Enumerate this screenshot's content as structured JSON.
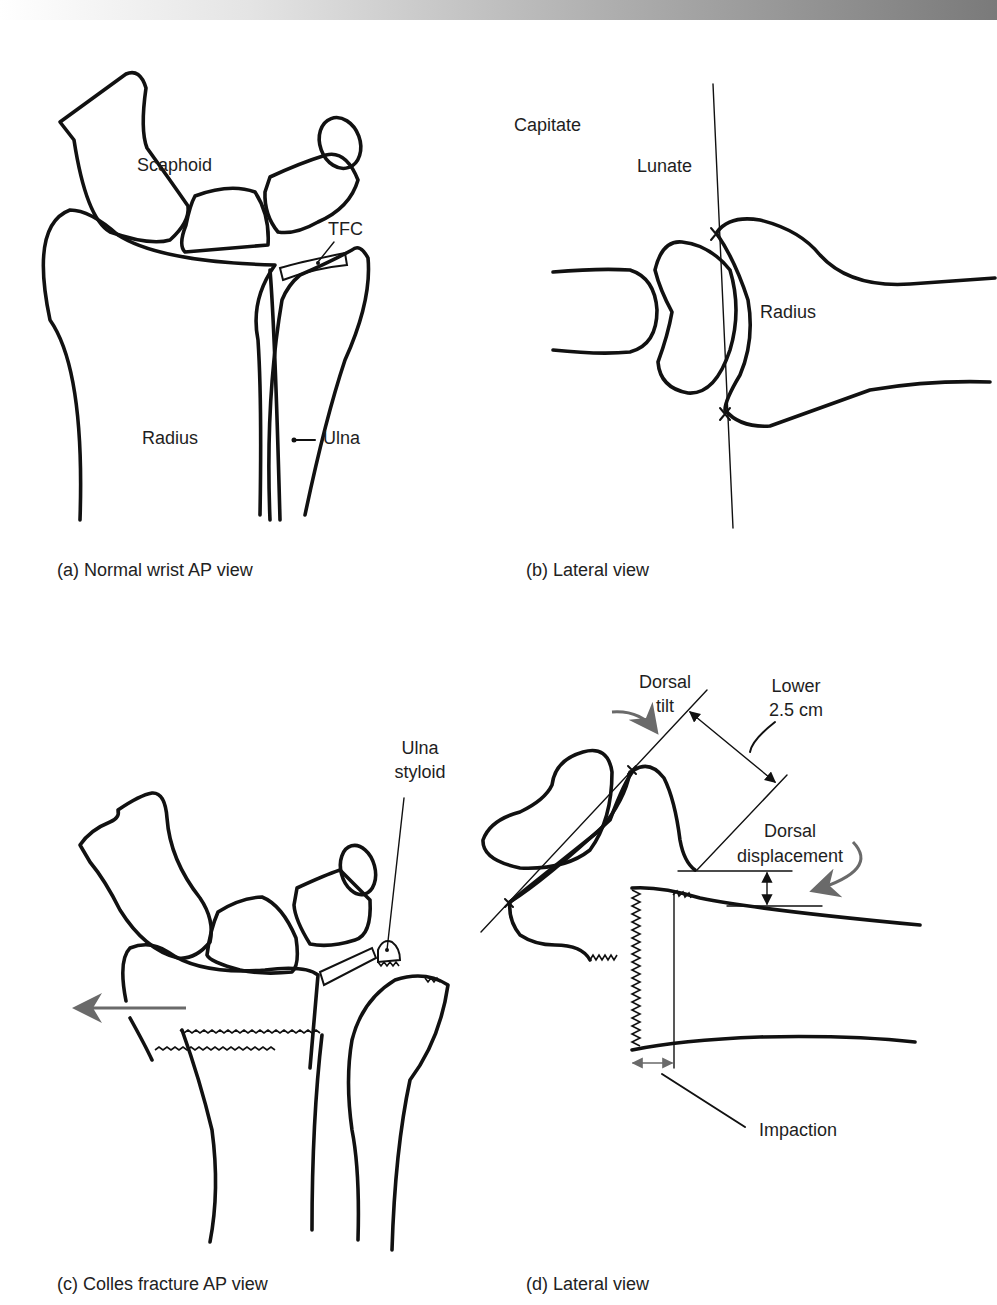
{
  "figure": {
    "panels": [
      {
        "id": "a",
        "caption": "(a) Normal wrist AP view",
        "labels": {
          "scaphoid": "Scaphoid",
          "tfc": "TFC",
          "radius": "Radius",
          "ulna": "Ulna"
        }
      },
      {
        "id": "b",
        "caption": "(b) Lateral view",
        "labels": {
          "capitate": "Capitate",
          "lunate": "Lunate",
          "radius": "Radius"
        }
      },
      {
        "id": "c",
        "caption": "(c) Colles fracture AP view",
        "labels": {
          "ulna_styloid_line1": "Ulna",
          "ulna_styloid_line2": "styloid"
        }
      },
      {
        "id": "d",
        "caption": "(d) Lateral view",
        "labels": {
          "dorsal_tilt_line1": "Dorsal",
          "dorsal_tilt_line2": "tilt",
          "lower_line1": "Lower",
          "lower_line2": "2.5 cm",
          "dorsal_displacement_line1": "Dorsal",
          "dorsal_displacement_line2": "displacement",
          "impaction": "Impaction"
        }
      }
    ],
    "colors": {
      "line": "#111111",
      "arrow": "#6a6a6a",
      "background": "#ffffff"
    }
  }
}
